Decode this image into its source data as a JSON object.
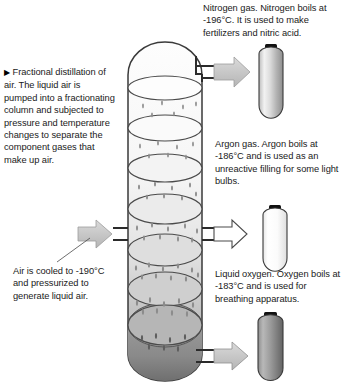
{
  "diagram": {
    "title": "Fractional distillation of air",
    "caption_left": {
      "marker": "▶",
      "text": "Fractional distillation of air. The liquid air is pumped into a fractionating column and subjected to pressure and temperature changes to separate the component gases that make up air."
    },
    "annotations": {
      "nitrogen": "Nitrogen gas. Nitrogen boils at -196°C. It is used to make fertilizers and nitric acid.",
      "argon": "Argon gas. Argon boils at -186°C and is used as an unreactive filling for some light bulbs.",
      "oxygen": "Liquid oxygen. Oxygen boils at -183°C and is used for breathing apparatus.",
      "inlet": "Air is cooled to -190°C and pressurized to generate liquid air."
    },
    "outputs": [
      {
        "name": "nitrogen",
        "label": "Nitrogen gas",
        "boiling_point": "-196°C",
        "arrow_style": "filled-gray",
        "cylinder_fill": "light",
        "position": "top"
      },
      {
        "name": "argon",
        "label": "Argon gas",
        "boiling_point": "-186°C",
        "arrow_style": "outline-white",
        "cylinder_fill": "white",
        "position": "middle"
      },
      {
        "name": "oxygen",
        "label": "Liquid oxygen",
        "boiling_point": "-183°C",
        "arrow_style": "filled-gray",
        "cylinder_fill": "dark",
        "position": "bottom"
      }
    ],
    "inlet": {
      "name": "liquid-air-inlet",
      "temperature": "-190°C",
      "arrow_style": "filled-gray"
    },
    "column": {
      "tray_count": 7,
      "has_domed_top": true,
      "has_rounded_base": true,
      "droplets": true
    },
    "colors": {
      "outline": "#3a3a3a",
      "arrow_fill": "#c9c9c9",
      "arrow_outline": "#6b6b6b",
      "cap": "#111111",
      "column_top": "#fbfbfb",
      "column_bottom": "#8e8e8e",
      "text": "#1a1a1a"
    }
  }
}
